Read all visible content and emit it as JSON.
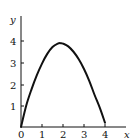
{
  "chart_data": {
    "type": "line",
    "title": "",
    "xlabel": "x",
    "ylabel": "y",
    "xlim": [
      0,
      4.5
    ],
    "ylim": [
      0,
      4.6
    ],
    "x_ticks": [
      "0",
      "1",
      "2",
      "3",
      "4"
    ],
    "y_ticks": [
      "1",
      "2",
      "3",
      "4"
    ],
    "grid": false,
    "legend": null,
    "series": [
      {
        "name": "curve",
        "x": [
          0,
          0.25,
          0.5,
          0.75,
          1.0,
          1.25,
          1.5,
          1.75,
          1.9,
          2.0,
          2.25,
          2.5,
          2.75,
          3.0,
          3.25,
          3.5,
          3.75,
          4.0
        ],
        "y": [
          0,
          1.0,
          1.75,
          2.4,
          2.95,
          3.4,
          3.72,
          3.88,
          3.9,
          3.88,
          3.75,
          3.5,
          3.15,
          2.7,
          2.15,
          1.5,
          0.9,
          0.2
        ]
      }
    ],
    "colors": {
      "axes": "#111111",
      "curve": "#111111"
    }
  }
}
